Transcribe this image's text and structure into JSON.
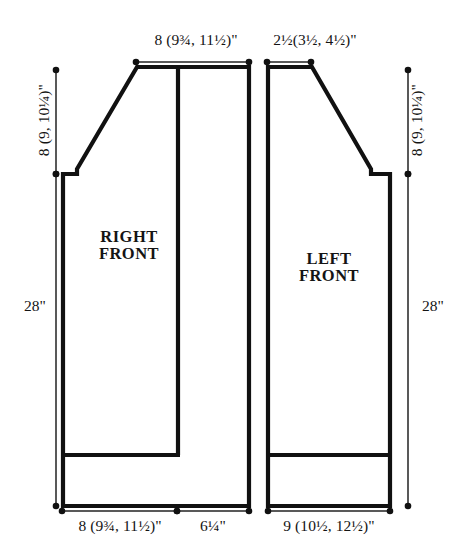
{
  "diagram": {
    "type": "garment-schematic",
    "background_color": "#ffffff",
    "line_color": "#111111",
    "panels": [
      {
        "id": "right-front",
        "label_line1": "RIGHT",
        "label_line2": "FRONT"
      },
      {
        "id": "left-front",
        "label_line1": "LEFT",
        "label_line2": "FRONT"
      }
    ],
    "dimensions": {
      "right_front_shoulder_top": {
        "text": "8 (9¾, 11½)\"",
        "value_sizes": [
          "8",
          "9¾",
          "11½"
        ],
        "unit": "inch",
        "position": "top-left-of-right-front"
      },
      "left_front_shoulder_top": {
        "text": "2½(3½, 4½)\"",
        "value_sizes": [
          "2½",
          "3½",
          "4½"
        ],
        "unit": "inch",
        "position": "top-of-left-front"
      },
      "right_armhole_depth": {
        "text": "8 (9, 10¼)\"",
        "value_sizes": [
          "8",
          "9",
          "10¼"
        ],
        "unit": "inch",
        "position": "left-side-upper"
      },
      "left_armhole_depth": {
        "text": "8 (9, 10¼)\"",
        "value_sizes": [
          "8",
          "9",
          "10¼"
        ],
        "unit": "inch",
        "position": "right-side-upper"
      },
      "right_total_length": {
        "text": "28\"",
        "value_sizes": [
          "28"
        ],
        "unit": "inch",
        "position": "left-side-full"
      },
      "left_total_length": {
        "text": "28\"",
        "value_sizes": [
          "28"
        ],
        "unit": "inch",
        "position": "right-side-full"
      },
      "right_front_bottom_width": {
        "text": "8 (9¾, 11½)\"",
        "value_sizes": [
          "8",
          "9¾",
          "11½"
        ],
        "unit": "inch",
        "position": "bottom-left"
      },
      "right_front_band_width": {
        "text": "6¼\"",
        "value_sizes": [
          "6¼"
        ],
        "unit": "inch",
        "position": "bottom-middle"
      },
      "left_front_bottom_width": {
        "text": "9 (10½, 12½)\"",
        "value_sizes": [
          "9",
          "10½",
          "12½"
        ],
        "unit": "inch",
        "position": "bottom-right"
      }
    }
  }
}
